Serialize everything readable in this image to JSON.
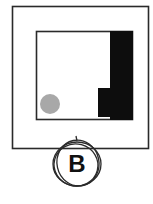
{
  "figure": {
    "label": "B",
    "colors": {
      "stroke": "#2a2a2a",
      "fill_dark": "#0d0d0d",
      "circle_fill": "#a8a8a8",
      "background": "#ffffff"
    }
  }
}
